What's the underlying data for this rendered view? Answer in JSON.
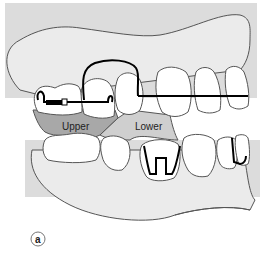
{
  "figure": {
    "panel_label": "a",
    "labels": {
      "upper": "Upper",
      "lower": "Lower"
    },
    "colors": {
      "background_gray": "#dcdcdc",
      "gum_fill": "#ebebeb",
      "tooth_fill": "#ffffff",
      "upper_region": "#a8a8a8",
      "lower_region": "#cfcfcf",
      "outline": "#555555",
      "wire": "#000000"
    }
  }
}
